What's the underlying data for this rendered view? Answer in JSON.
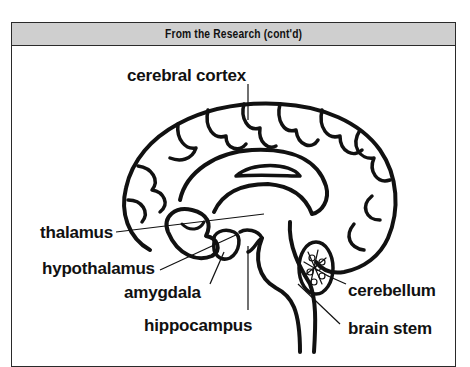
{
  "header": {
    "title": "From the Research (cont'd)"
  },
  "diagram": {
    "labels": {
      "cerebral_cortex": "cerebral cortex",
      "thalamus": "thalamus",
      "hypothalamus": "hypothalamus",
      "amygdala": "amygdala",
      "hippocampus": "hippocampus",
      "cerebellum": "cerebellum",
      "brain_stem": "brain stem"
    }
  },
  "colors": {
    "header_bg": "#cfcfcf",
    "border": "#2a2a2a",
    "ink": "#111111"
  }
}
